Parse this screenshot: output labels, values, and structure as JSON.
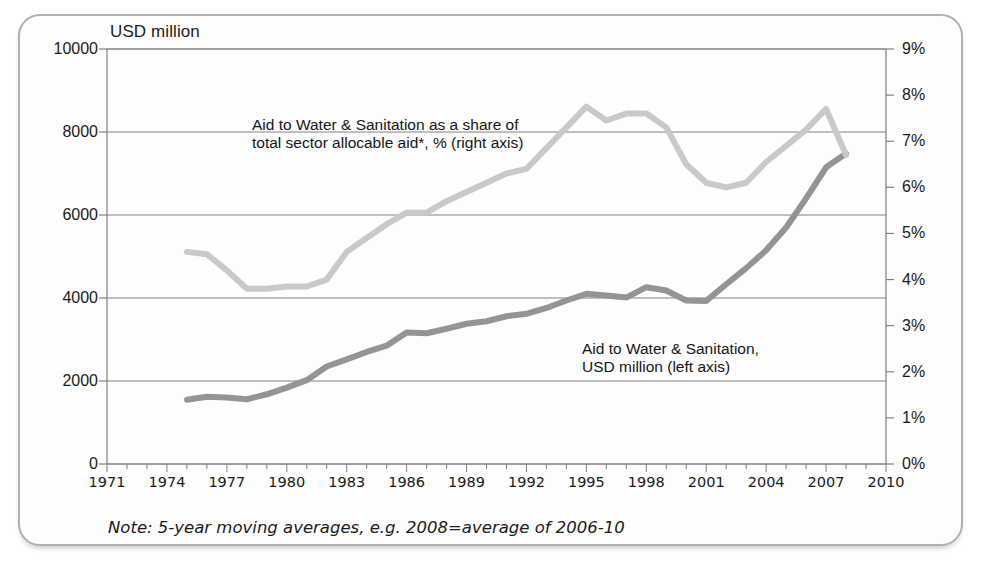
{
  "axis_title": "USD million",
  "footnote": "Note: 5-year moving averages, e.g. 2008=average of 2006-10",
  "annotations": {
    "pct_line1": "Aid to Water & Sanitation  as a share of",
    "pct_line2": "total sector allocable aid*, % (right axis)",
    "usd_line1": "Aid to Water & Sanitation,",
    "usd_line2": "USD million (left axis)"
  },
  "colors": {
    "usd_series": "#949494",
    "pct_series": "#c9c9c9",
    "gridline": "#808080",
    "frame": "#b0b0b0",
    "text": "#1a1a1a",
    "plot_background": "#fdfdfd"
  },
  "chart_data": {
    "type": "line",
    "title": "",
    "subtitle": "",
    "xlabel": "",
    "ylabel": "USD million",
    "y2label": "%",
    "xlim": [
      1971,
      2010
    ],
    "ylim": [
      0,
      10000
    ],
    "y2lim": [
      0,
      9
    ],
    "grid": true,
    "legend_position": "inline-annotations",
    "x_tick_labels": [
      "1971",
      "1974",
      "1977",
      "1980",
      "1983",
      "1986",
      "1989",
      "1992",
      "1995",
      "1998",
      "2001",
      "2004",
      "2007",
      "2010"
    ],
    "x_ticks": [
      1971,
      1974,
      1977,
      1980,
      1983,
      1986,
      1989,
      1992,
      1995,
      1998,
      2001,
      2004,
      2007,
      2010
    ],
    "y_tick_labels": [
      "0",
      "2000",
      "4000",
      "6000",
      "8000",
      "10000"
    ],
    "y_ticks": [
      0,
      2000,
      4000,
      6000,
      8000,
      10000
    ],
    "y2_tick_labels": [
      "0%",
      "1%",
      "2%",
      "3%",
      "4%",
      "5%",
      "6%",
      "7%",
      "8%",
      "9%"
    ],
    "y2_ticks": [
      0,
      1,
      2,
      3,
      4,
      5,
      6,
      7,
      8,
      9
    ],
    "x": [
      1975,
      1976,
      1977,
      1978,
      1979,
      1980,
      1981,
      1982,
      1983,
      1984,
      1985,
      1986,
      1987,
      1988,
      1989,
      1990,
      1991,
      1992,
      1993,
      1994,
      1995,
      1996,
      1997,
      1998,
      1999,
      2000,
      2001,
      2002,
      2003,
      2004,
      2005,
      2006,
      2007,
      2008
    ],
    "series": [
      {
        "name": "Aid to Water & Sanitation, USD million (left axis)",
        "axis": "left",
        "unit": "USD million",
        "color": "#949494",
        "values": [
          1550,
          1620,
          1600,
          1560,
          1680,
          1840,
          2020,
          2350,
          2520,
          2700,
          2850,
          3170,
          3150,
          3260,
          3380,
          3440,
          3560,
          3620,
          3760,
          3940,
          4100,
          4060,
          4010,
          4260,
          4180,
          3940,
          3930,
          4330,
          4720,
          5150,
          5700,
          6400,
          7150,
          7480
        ]
      },
      {
        "name": "Aid to Water & Sanitation as a share of total sector allocable aid*, % (right axis)",
        "axis": "right",
        "unit": "%",
        "color": "#c9c9c9",
        "values": [
          4.6,
          4.55,
          4.2,
          3.8,
          3.8,
          3.85,
          3.85,
          4.0,
          4.6,
          4.9,
          5.2,
          5.45,
          5.45,
          5.7,
          5.9,
          6.1,
          6.3,
          6.4,
          6.85,
          7.3,
          7.75,
          7.45,
          7.6,
          7.6,
          7.3,
          6.5,
          6.1,
          6.0,
          6.1,
          6.55,
          6.9,
          7.25,
          7.7,
          6.7
        ]
      }
    ]
  }
}
